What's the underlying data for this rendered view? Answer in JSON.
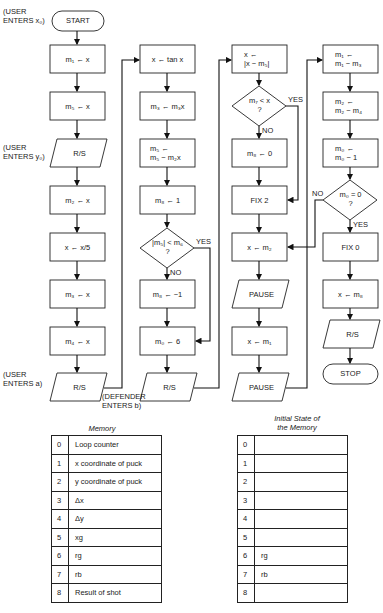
{
  "flowchart": {
    "col1": {
      "start": "START",
      "step1": "m₁ ← x",
      "step2": "m₅ ← x",
      "rs1": "R/S",
      "step3": "m₂ ← x",
      "step4": "x ← x/5",
      "step5": "m₃ ← x",
      "step6": "m₄ ← x",
      "rs2": "R/S"
    },
    "col2": {
      "step1": "x ← tan x",
      "step2": "m₃ ← m₃x",
      "step3_l1": "m₅ ←",
      "step3_l2": "m₅ − m₂x",
      "step4": "m₈ ← 1",
      "decision_l1": "|m₅| < m₆",
      "decision_l2": "?",
      "yes": "YES",
      "no": "NO",
      "step5": "m₈ ← −1",
      "step6": "m₀ ← 6",
      "rs": "R/S"
    },
    "col3": {
      "step1_l1": "x ←",
      "step1_l2": "|x − m₅|",
      "decision_l1": "m₇ < x",
      "decision_l2": "?",
      "yes": "YES",
      "no": "NO",
      "step2": "m₈ ← 0",
      "step3": "FIX 2",
      "step4": "x ← m₂",
      "pause1": "PAUSE",
      "step5": "x ← m₁",
      "pause2": "PAUSE"
    },
    "col4": {
      "step1_l1": "m₁ ←",
      "step1_l2": "m₁ − m₃",
      "step2_l1": "m₂ ←",
      "step2_l2": "m₂ − m₄",
      "step3_l1": "m₀ ←",
      "step3_l2": "m₀ − 1",
      "decision_l1": "m₀ = 0",
      "decision_l2": "?",
      "yes": "YES",
      "no": "NO",
      "step4": "FIX 0",
      "step5": "x ← m₈",
      "rs": "R/S",
      "stop": "STOP"
    },
    "notes": {
      "user_x0_l1": "(USER",
      "user_x0_l2": "ENTERS x₀)",
      "user_y0_l1": "(USER",
      "user_y0_l2": "ENTERS y₀)",
      "user_a_l1": "(USER",
      "user_a_l2": "ENTERS a)",
      "defender_l1": "(DEFENDER",
      "defender_l2": "ENTERS b)"
    }
  },
  "memory_table": {
    "caption": "Memory",
    "rows": [
      {
        "index": "0",
        "value": "Loop counter"
      },
      {
        "index": "1",
        "value": "x coordinate of puck"
      },
      {
        "index": "2",
        "value": "y coordinate of puck"
      },
      {
        "index": "3",
        "value": "Δx"
      },
      {
        "index": "4",
        "value": "Δy"
      },
      {
        "index": "5",
        "value": "xg"
      },
      {
        "index": "6",
        "value": "rg"
      },
      {
        "index": "7",
        "value": "rb"
      },
      {
        "index": "8",
        "value": "Result of shot"
      }
    ]
  },
  "initial_memory_table": {
    "caption_l1": "Initial State of",
    "caption_l2": "the Memory",
    "rows": [
      {
        "index": "0",
        "value": ""
      },
      {
        "index": "1",
        "value": ""
      },
      {
        "index": "2",
        "value": ""
      },
      {
        "index": "3",
        "value": ""
      },
      {
        "index": "4",
        "value": ""
      },
      {
        "index": "5",
        "value": ""
      },
      {
        "index": "6",
        "value": "rg"
      },
      {
        "index": "7",
        "value": "rb"
      },
      {
        "index": "8",
        "value": ""
      }
    ]
  }
}
